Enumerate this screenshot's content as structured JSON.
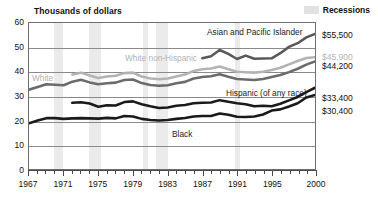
{
  "header": {
    "axis_title": "Thousands of dollars",
    "legend": {
      "swatch_name": "recession-swatch",
      "label": "Recessions",
      "color": "#e2e2e2"
    }
  },
  "series_labels": [
    {
      "name": "asian-pacific-islander",
      "text": "Asian and Pacific Islander",
      "tone": "dark",
      "left": 207,
      "top": 27
    },
    {
      "name": "white-non-hispanic",
      "text": "White non-Hispanic",
      "tone": "gray",
      "left": 125,
      "top": 53
    },
    {
      "name": "white",
      "text": "White",
      "tone": "gray",
      "left": 32,
      "top": 73
    },
    {
      "name": "hispanic",
      "text": "Hispanic (of any race)",
      "tone": "dark",
      "left": 226,
      "top": 88
    },
    {
      "name": "black",
      "text": "Black",
      "tone": "dark",
      "left": 172,
      "top": 129
    }
  ],
  "value_labels": [
    {
      "name": "value-asian-pacific-islander",
      "text": "$55,500",
      "tone": "dark",
      "top": 30
    },
    {
      "name": "value-white-non-hispanic",
      "text": "$45,900",
      "tone": "gray",
      "top": 52
    },
    {
      "name": "value-white",
      "text": "$44,200",
      "tone": "dark",
      "top": 61
    },
    {
      "name": "value-hispanic",
      "text": "$33,400",
      "tone": "dark",
      "top": 93
    },
    {
      "name": "value-black",
      "text": "$30,400",
      "tone": "dark",
      "top": 106
    }
  ],
  "chart_data": {
    "type": "line",
    "title": "",
    "xlabel": "",
    "ylabel": "Thousands of dollars",
    "xlim": [
      1967,
      2000
    ],
    "ylim": [
      0,
      60
    ],
    "yticks": [
      0,
      10,
      20,
      30,
      40,
      50,
      60
    ],
    "grid": true,
    "legend_position": "top-right",
    "x_tick_labels": [
      1967,
      1971,
      1975,
      1979,
      1983,
      1987,
      1991,
      1995,
      2000
    ],
    "x_all_ticks": [
      1967,
      1968,
      1969,
      1970,
      1971,
      1972,
      1973,
      1974,
      1975,
      1976,
      1977,
      1978,
      1979,
      1980,
      1981,
      1982,
      1983,
      1984,
      1985,
      1986,
      1987,
      1988,
      1989,
      1990,
      1991,
      1992,
      1993,
      1994,
      1995,
      1996,
      1997,
      1998,
      1999,
      2000
    ],
    "recessions": [
      {
        "start": 1969.9,
        "end": 1970.9
      },
      {
        "start": 1973.9,
        "end": 1975.2
      },
      {
        "start": 1980.1,
        "end": 1980.6
      },
      {
        "start": 1981.6,
        "end": 1982.9
      },
      {
        "start": 1990.6,
        "end": 1991.2
      }
    ],
    "series": [
      {
        "name": "Asian and Pacific Islander",
        "color": "#595959",
        "width": 2.6,
        "end_value": 55.5,
        "x": [
          1987,
          1988,
          1989,
          1990,
          1991,
          1992,
          1993,
          1994,
          1995,
          1996,
          1997,
          1998,
          1999,
          2000
        ],
        "values": [
          45.5,
          46.3,
          48.9,
          47.3,
          45.2,
          46.6,
          45.3,
          45.4,
          45.5,
          47.6,
          50.2,
          51.7,
          54.1,
          55.5
        ]
      },
      {
        "name": "White non-Hispanic",
        "color": "#b3b3b3",
        "width": 2.6,
        "end_value": 45.9,
        "x": [
          1972,
          1973,
          1974,
          1975,
          1976,
          1977,
          1978,
          1979,
          1980,
          1981,
          1982,
          1983,
          1984,
          1985,
          1986,
          1987,
          1988,
          1989,
          1990,
          1991,
          1992,
          1993,
          1994,
          1995,
          1996,
          1997,
          1998,
          1999,
          2000
        ],
        "values": [
          38.8,
          39.6,
          38.4,
          37.4,
          38.0,
          38.3,
          39.4,
          39.6,
          38.0,
          37.2,
          36.9,
          37.2,
          38.0,
          38.8,
          40.3,
          41.0,
          41.3,
          42.1,
          41.0,
          40.0,
          39.8,
          39.6,
          40.0,
          40.7,
          41.6,
          43.0,
          44.4,
          45.6,
          45.9
        ]
      },
      {
        "name": "White",
        "color": "#6b6b6b",
        "width": 2.6,
        "end_value": 44.2,
        "x": [
          1967,
          1968,
          1969,
          1970,
          1971,
          1972,
          1973,
          1974,
          1975,
          1976,
          1977,
          1978,
          1979,
          1980,
          1981,
          1982,
          1983,
          1984,
          1985,
          1986,
          1987,
          1988,
          1989,
          1990,
          1991,
          1992,
          1993,
          1994,
          1995,
          1996,
          1997,
          1998,
          1999,
          2000
        ],
        "values": [
          32.6,
          33.7,
          34.8,
          34.6,
          34.4,
          35.9,
          36.7,
          35.6,
          34.8,
          35.2,
          35.5,
          36.6,
          36.8,
          35.3,
          34.5,
          34.2,
          34.4,
          35.2,
          35.8,
          37.2,
          37.8,
          38.1,
          38.9,
          37.9,
          37.0,
          36.8,
          36.6,
          37.0,
          37.8,
          38.6,
          39.8,
          41.2,
          42.9,
          44.2
        ]
      },
      {
        "name": "Hispanic (of any race)",
        "color": "#1a1a1a",
        "width": 2.6,
        "end_value": 33.4,
        "x": [
          1972,
          1973,
          1974,
          1975,
          1976,
          1977,
          1978,
          1979,
          1980,
          1981,
          1982,
          1983,
          1984,
          1985,
          1986,
          1987,
          1988,
          1989,
          1990,
          1991,
          1992,
          1993,
          1994,
          1995,
          1996,
          1997,
          1998,
          1999,
          2000
        ],
        "values": [
          27.2,
          27.4,
          26.9,
          25.6,
          26.2,
          26.1,
          27.5,
          27.8,
          26.6,
          25.8,
          25.1,
          25.3,
          26.0,
          26.3,
          27.0,
          27.2,
          27.3,
          28.3,
          27.6,
          27.0,
          26.6,
          25.8,
          26.0,
          25.8,
          26.8,
          28.2,
          29.6,
          31.6,
          33.4
        ]
      },
      {
        "name": "Black",
        "color": "#1a1a1a",
        "width": 2.6,
        "end_value": 30.4,
        "x": [
          1967,
          1968,
          1969,
          1970,
          1971,
          1972,
          1973,
          1974,
          1975,
          1976,
          1977,
          1978,
          1979,
          1980,
          1981,
          1982,
          1983,
          1984,
          1985,
          1986,
          1987,
          1988,
          1989,
          1990,
          1991,
          1992,
          1993,
          1994,
          1995,
          1996,
          1997,
          1998,
          1999,
          2000
        ],
        "values": [
          18.8,
          19.9,
          20.9,
          20.9,
          20.6,
          20.8,
          20.9,
          20.8,
          20.7,
          21.0,
          20.8,
          21.8,
          21.6,
          20.6,
          20.1,
          19.9,
          20.1,
          20.6,
          21.0,
          21.6,
          21.8,
          21.8,
          22.8,
          22.3,
          21.5,
          21.4,
          21.6,
          22.4,
          24.0,
          24.5,
          25.7,
          27.0,
          29.4,
          30.4
        ]
      }
    ]
  }
}
